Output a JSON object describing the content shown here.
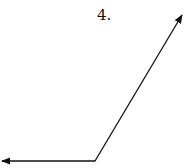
{
  "diagram": {
    "type": "angle",
    "label": "4.",
    "vertex": {
      "x": 95,
      "y": 161
    },
    "rays": [
      {
        "name": "left-ray",
        "end": {
          "x": 1,
          "y": 161
        }
      },
      {
        "name": "upper-right-ray",
        "end": {
          "x": 183,
          "y": 14
        }
      }
    ],
    "stroke_color": "#111111"
  }
}
